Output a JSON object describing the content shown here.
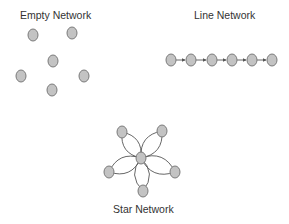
{
  "diagram": {
    "node_style": {
      "fill": "#c3c3c3",
      "stroke": "#7a7a7a",
      "rx": 5,
      "ry": 6
    },
    "edge_color": "#555555",
    "panels": [
      {
        "id": "empty",
        "title": "Empty Network",
        "nodes": [
          [
            33,
            35
          ],
          [
            72,
            33
          ],
          [
            53,
            61
          ],
          [
            21,
            76
          ],
          [
            84,
            76
          ],
          [
            52,
            90
          ]
        ],
        "edges": []
      },
      {
        "id": "line",
        "title": "Line Network",
        "nodes": [
          [
            171,
            60
          ],
          [
            191,
            60
          ],
          [
            212,
            60
          ],
          [
            232,
            60
          ],
          [
            252,
            60
          ],
          [
            272,
            60
          ]
        ],
        "edges": [
          [
            0,
            1
          ],
          [
            1,
            2
          ],
          [
            2,
            3
          ],
          [
            3,
            4
          ],
          [
            4,
            5
          ]
        ]
      },
      {
        "id": "star",
        "title": "Star Network",
        "center": [
          141,
          158
        ],
        "leaves": [
          [
            122,
            132
          ],
          [
            162,
            131
          ],
          [
            109,
            172
          ],
          [
            175,
            172
          ],
          [
            143,
            191
          ]
        ]
      }
    ]
  }
}
